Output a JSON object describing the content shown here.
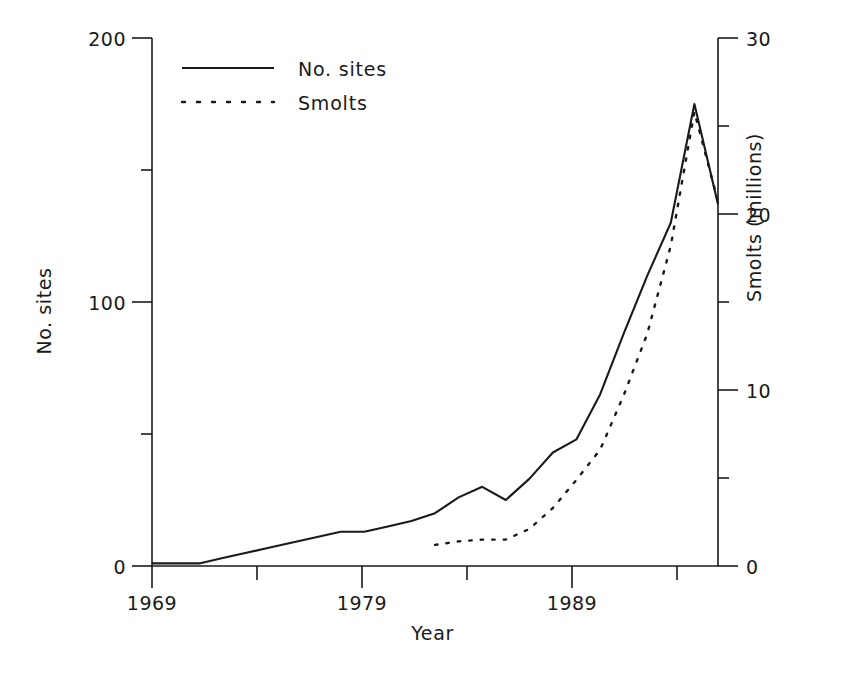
{
  "chart_data": {
    "type": "line",
    "title": "",
    "xlabel": "Year",
    "ylabel": "No. sites",
    "ylabel_right": "Smolts (millions)",
    "xlim": [
      1969,
      1993
    ],
    "ylim": [
      0,
      200
    ],
    "ylim_right": [
      0,
      30
    ],
    "xticks": [
      1969,
      1979,
      1989
    ],
    "xtick_labels": [
      "1969",
      "1979",
      "1989"
    ],
    "xminor_ticks": [
      1974,
      1984,
      1993
    ],
    "yticks_left": [
      0,
      100,
      200
    ],
    "ytick_labels_left": [
      "0",
      "100",
      "200"
    ],
    "yminor_ticks_left": [
      50,
      150
    ],
    "yticks_right": [
      0,
      10,
      20,
      30
    ],
    "ytick_labels_right": [
      "0",
      "10",
      "20",
      "30"
    ],
    "yminor_ticks_right": [
      5,
      15,
      25
    ],
    "grid": false,
    "legend_position": "upper-left-inside",
    "series": [
      {
        "name": "No. sites",
        "style": "solid",
        "axis": "left",
        "x": [
          1969,
          1970,
          1971,
          1972,
          1973,
          1974,
          1975,
          1976,
          1977,
          1978,
          1979,
          1980,
          1981,
          1982,
          1983,
          1984,
          1985,
          1986,
          1987,
          1988,
          1989,
          1990,
          1991,
          1992,
          1993
        ],
        "values": [
          1,
          1,
          1,
          3,
          5,
          7,
          9,
          11,
          13,
          13,
          15,
          17,
          20,
          26,
          30,
          25,
          33,
          43,
          48,
          65,
          88,
          110,
          130,
          175,
          137
        ]
      },
      {
        "name": "Smolts",
        "style": "dotted",
        "axis": "right",
        "x": [
          1981,
          1982,
          1983,
          1984,
          1985,
          1986,
          1987,
          1988,
          1989,
          1990,
          1991,
          1992,
          1993
        ],
        "values": [
          1.2,
          1.4,
          1.5,
          1.5,
          2.1,
          3.3,
          4.9,
          6.6,
          9.7,
          13.2,
          18.2,
          25.8,
          20.7
        ]
      }
    ],
    "legend": [
      {
        "label": "No. sites",
        "style": "solid"
      },
      {
        "label": "Smolts",
        "style": "dotted"
      }
    ]
  }
}
